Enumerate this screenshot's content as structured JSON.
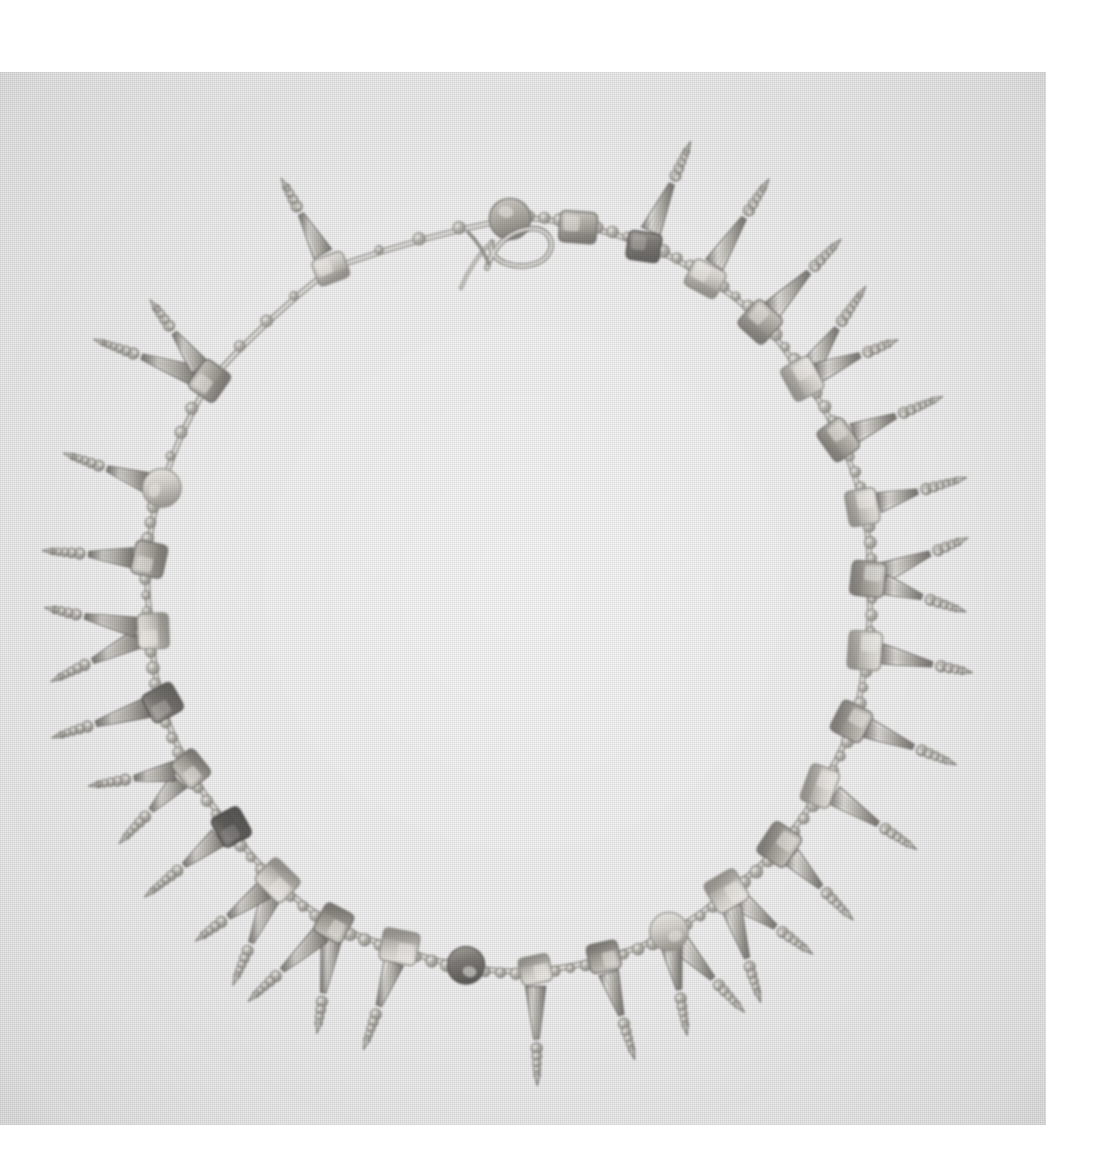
{
  "image": {
    "subject": "ancient beaded necklace with pendant drops",
    "medium": "black-and-white photograph",
    "orientation": "square",
    "background_color": "#f0f0f0",
    "paper_color": "#ffffff",
    "photo_bounds": {
      "x": 0,
      "y": 72,
      "width": 1046,
      "height": 1053
    }
  },
  "object": {
    "name": "Necklace",
    "form": "closed circular strand laid flat",
    "clasp": {
      "type": "hook-and-eye-clasp",
      "position": "top-center",
      "x": 520,
      "y": 115
    },
    "materials_visible": [
      "metal",
      "stone",
      "glass"
    ],
    "component_counts": {
      "square_beads": 24,
      "round_beads": 5,
      "pendant_drops": 27,
      "chain_links": 48
    }
  },
  "palette": {
    "background": "#f0f0f0",
    "metal_light": "#e4e2dd",
    "metal_mid": "#b9b6ae",
    "metal_shadow": "#6f6c66",
    "bead_pale": "#d6d3cc",
    "bead_mid": "#a8a49b",
    "bead_dark": "#57544e",
    "bead_darkest": "#3a3834",
    "outline": "#4a4843"
  },
  "geometry": {
    "center_x": 510,
    "center_y": 520,
    "radius_x": 360,
    "radius_y": 375,
    "station_count": 29
  },
  "chart_data": {
    "type": "scatter",
    "xlabel": "angle (degrees)",
    "ylabel": "radius (px)",
    "stations": [
      {
        "angle": 270,
        "bead": "round",
        "tone": "mid",
        "drops": 0
      },
      {
        "angle": 281,
        "bead": "square",
        "tone": "mid",
        "drops": 0
      },
      {
        "angle": 292,
        "bead": "square",
        "tone": "dark",
        "drops": 1
      },
      {
        "angle": 303,
        "bead": "square",
        "tone": "pale",
        "drops": 1
      },
      {
        "angle": 314,
        "bead": "square",
        "tone": "mid",
        "drops": 1
      },
      {
        "angle": 325,
        "bead": "square",
        "tone": "pale",
        "drops": 2
      },
      {
        "angle": 336,
        "bead": "square",
        "tone": "mid",
        "drops": 1
      },
      {
        "angle": 347,
        "bead": "square",
        "tone": "pale",
        "drops": 1
      },
      {
        "angle": 358,
        "bead": "square",
        "tone": "mid",
        "drops": 2
      },
      {
        "angle": 9,
        "bead": "square",
        "tone": "pale",
        "drops": 1
      },
      {
        "angle": 20,
        "bead": "square",
        "tone": "mid",
        "drops": 1
      },
      {
        "angle": 31,
        "bead": "square",
        "tone": "pale",
        "drops": 1
      },
      {
        "angle": 42,
        "bead": "square",
        "tone": "mid",
        "drops": 1
      },
      {
        "angle": 53,
        "bead": "square",
        "tone": "pale",
        "drops": 2
      },
      {
        "angle": 64,
        "bead": "round",
        "tone": "pale",
        "drops": 2
      },
      {
        "angle": 75,
        "bead": "square",
        "tone": "mid",
        "drops": 1
      },
      {
        "angle": 86,
        "bead": "square",
        "tone": "pale",
        "drops": 1
      },
      {
        "angle": 97,
        "bead": "round",
        "tone": "dark",
        "drops": 0
      },
      {
        "angle": 108,
        "bead": "square",
        "tone": "pale",
        "drops": 1
      },
      {
        "angle": 119,
        "bead": "square",
        "tone": "mid",
        "drops": 2
      },
      {
        "angle": 130,
        "bead": "square",
        "tone": "pale",
        "drops": 2
      },
      {
        "angle": 141,
        "bead": "square",
        "tone": "darkest",
        "drops": 1
      },
      {
        "angle": 152,
        "bead": "square",
        "tone": "mid",
        "drops": 2
      },
      {
        "angle": 163,
        "bead": "square",
        "tone": "dark",
        "drops": 1
      },
      {
        "angle": 174,
        "bead": "square",
        "tone": "pale",
        "drops": 2
      },
      {
        "angle": 185,
        "bead": "square",
        "tone": "mid",
        "drops": 1
      },
      {
        "angle": 196,
        "bead": "round",
        "tone": "pale",
        "drops": 1
      },
      {
        "angle": 214,
        "bead": "square",
        "tone": "mid",
        "drops": 2
      },
      {
        "angle": 240,
        "bead": "square",
        "tone": "pale",
        "drops": 1
      }
    ]
  }
}
